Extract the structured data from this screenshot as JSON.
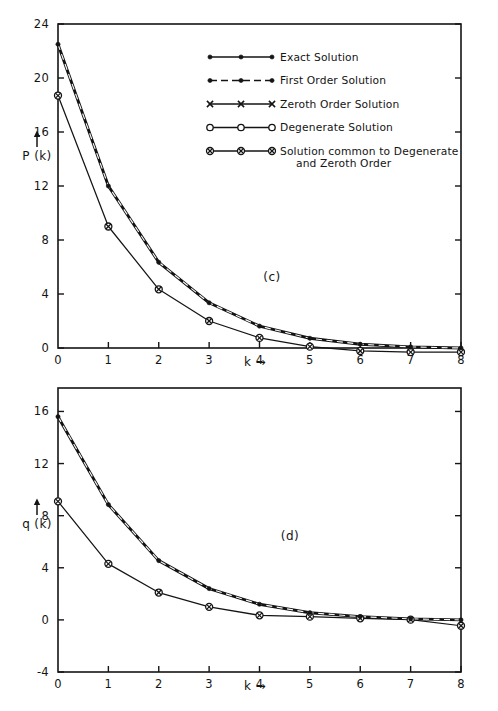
{
  "figure": {
    "background": "#ffffff",
    "ink_color": "#141414"
  },
  "legend": {
    "items": [
      {
        "label": "Exact Solution",
        "marker": "filled-dot",
        "line": "solid"
      },
      {
        "label": "First Order Solution",
        "marker": "filled-dot",
        "line": "dashed"
      },
      {
        "label": "Zeroth Order Solution",
        "marker": "cross-x",
        "line": "solid"
      },
      {
        "label": "Degenerate Solution",
        "marker": "open-circle",
        "line": "solid"
      },
      {
        "label": "Solution common to Degenerate",
        "label_line2": "and Zeroth Order",
        "marker": "crossed-circle",
        "line": "solid"
      }
    ]
  },
  "chart_data": [
    {
      "type": "line",
      "panel_label": "(c)",
      "title": "",
      "xlabel": "k →",
      "ylabel": "P (k)",
      "x": [
        0,
        1,
        2,
        3,
        4,
        5,
        6,
        7,
        8
      ],
      "xticklabels": [
        "0",
        "1",
        "2",
        "3",
        "4",
        "5",
        "6",
        "7",
        "8"
      ],
      "yticklabels": [
        "0",
        "4",
        "8",
        "12",
        "16",
        "20",
        "24"
      ],
      "yticks": [
        0,
        4,
        8,
        12,
        16,
        20,
        24
      ],
      "xlim": [
        0,
        8
      ],
      "ylim": [
        0,
        24
      ],
      "grid": false,
      "legend_position": "upper-right-inside",
      "series": [
        {
          "name": "Exact Solution",
          "marker": "filled-dot",
          "line": "solid",
          "values": [
            22.5,
            12.0,
            6.35,
            3.35,
            1.62,
            0.72,
            0.28,
            0.08,
            0.0
          ]
        },
        {
          "name": "First Order Solution",
          "marker": "filled-dot",
          "line": "dashed",
          "values": [
            22.2,
            11.85,
            6.2,
            3.25,
            1.55,
            0.65,
            0.22,
            0.05,
            0.0
          ]
        },
        {
          "name": "Zeroth Order Solution",
          "marker": "cross-x",
          "line": "solid",
          "values": [
            22.5,
            12.0,
            6.35,
            3.35,
            1.62,
            0.72,
            0.28,
            0.08,
            0.0
          ]
        },
        {
          "name": "Degenerate Solution",
          "marker": "open-circle",
          "line": "solid",
          "values": [
            18.7,
            9.0,
            4.35,
            2.0,
            0.75,
            0.1,
            -0.22,
            -0.3,
            -0.3
          ]
        },
        {
          "name": "Solution common to Degenerate and Zeroth Order",
          "marker": "crossed-circle",
          "line": "solid",
          "values": [
            18.7,
            9.0,
            4.35,
            2.0,
            0.75,
            0.1,
            -0.22,
            -0.3,
            -0.3
          ]
        }
      ]
    },
    {
      "type": "line",
      "panel_label": "(d)",
      "title": "",
      "xlabel": "k →",
      "ylabel": "q (k)",
      "x": [
        0,
        1,
        2,
        3,
        4,
        5,
        6,
        7,
        8
      ],
      "xticklabels": [
        "0",
        "1",
        "2",
        "3",
        "4",
        "5",
        "6",
        "7",
        "8"
      ],
      "yticklabels": [
        "-4",
        "0",
        "4",
        "8",
        "12",
        "16"
      ],
      "yticks": [
        -4,
        0,
        4,
        8,
        12,
        16
      ],
      "xlim": [
        0,
        8
      ],
      "ylim": [
        -4,
        17.8
      ],
      "grid": false,
      "legend_position": "none",
      "series": [
        {
          "name": "Exact Solution",
          "marker": "filled-dot",
          "line": "solid",
          "values": [
            15.6,
            8.85,
            4.55,
            2.4,
            1.2,
            0.55,
            0.25,
            0.08,
            0.0
          ]
        },
        {
          "name": "First Order Solution",
          "marker": "filled-dot",
          "line": "dashed",
          "values": [
            15.45,
            8.7,
            4.45,
            2.3,
            1.12,
            0.48,
            0.2,
            0.05,
            0.0
          ]
        },
        {
          "name": "Zeroth Order Solution",
          "marker": "cross-x",
          "line": "solid",
          "values": [
            15.6,
            8.85,
            4.55,
            2.4,
            1.2,
            0.55,
            0.25,
            0.08,
            0.0
          ]
        },
        {
          "name": "Degenerate Solution",
          "marker": "open-circle",
          "line": "solid",
          "values": [
            9.1,
            4.3,
            2.1,
            1.0,
            0.35,
            0.25,
            0.12,
            0.02,
            -0.45
          ]
        },
        {
          "name": "Solution common to Degenerate and Zeroth Order",
          "marker": "crossed-circle",
          "line": "solid",
          "values": [
            9.1,
            4.3,
            2.1,
            1.0,
            0.35,
            0.25,
            0.12,
            0.02,
            -0.45
          ]
        }
      ]
    }
  ]
}
